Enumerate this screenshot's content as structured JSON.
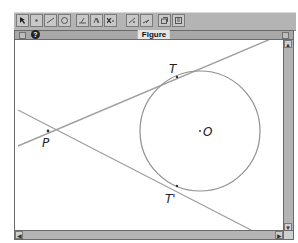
{
  "toolbar": {
    "groups": [
      {
        "tools": [
          "pointer-tool",
          "point-tool",
          "line-tool",
          "circle-tool"
        ]
      },
      {
        "tools": [
          "construct-tool",
          "transform-tool",
          "measure-tool"
        ]
      },
      {
        "tools": [
          "display-tool",
          "draw-tool"
        ]
      },
      {
        "tools": [
          "macro-tool",
          "text-tool"
        ]
      }
    ]
  },
  "window": {
    "title": "Figure",
    "help_glyph": "?"
  },
  "figure": {
    "labels": {
      "P": "P",
      "T": "T",
      "T_prime": "T'",
      "O": "O"
    },
    "colors": {
      "line": "#a0a0a0",
      "circle": "#909090",
      "text": "#222222"
    }
  },
  "scrollbars": {
    "up_arrow": "▲",
    "down_arrow": "▼",
    "left_arrow": "◀",
    "right_arrow": "▶"
  }
}
